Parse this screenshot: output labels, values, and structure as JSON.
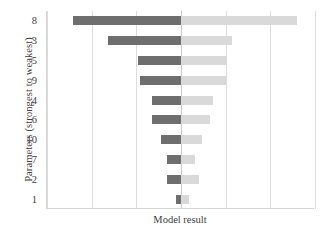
{
  "chart_data": {
    "type": "bar",
    "subtype": "tornado",
    "title": "",
    "xlabel": "Model result",
    "ylabel": "Parameters (strongest to weakest)",
    "orientation": "horizontal",
    "grid": true,
    "legend": "none",
    "center_value": 0,
    "xlim": [
      -3,
      3
    ],
    "xticks": [
      -3,
      -2,
      -1,
      0,
      1,
      2,
      3
    ],
    "xtick_labels": [
      "",
      "",
      "",
      "",
      "",
      "",
      ""
    ],
    "categories": [
      "8",
      "3",
      "5",
      "9",
      "4",
      "6",
      "10",
      "7",
      "2",
      "1"
    ],
    "series": [
      {
        "name": "low",
        "color": "#6e6e6e",
        "values": [
          -2.42,
          -1.63,
          -0.96,
          -0.91,
          -0.64,
          -0.64,
          -0.44,
          -0.31,
          -0.31,
          -0.11
        ]
      },
      {
        "name": "high",
        "color": "#d9d9d9",
        "values": [
          2.6,
          1.14,
          1.04,
          1.0,
          0.71,
          0.64,
          0.47,
          0.31,
          0.4,
          0.18
        ]
      }
    ]
  },
  "axes": {
    "y_title": "Parameters (strongest to weakest)",
    "x_title": "Model result",
    "y_tick_labels": [
      "8",
      "3",
      "5",
      "9",
      "4",
      "6",
      "10",
      "7",
      "2",
      "1"
    ]
  },
  "colors": {
    "bar_low": "#6e6e6e",
    "bar_high": "#d9d9d9",
    "gridline": "#dcdcdc",
    "axis": "#d4d4d4",
    "text": "#404040",
    "background": "#ffffff"
  }
}
